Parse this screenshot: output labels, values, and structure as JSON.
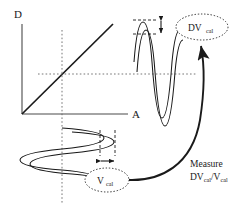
{
  "figure": {
    "background_color": "#ffffff",
    "ink_color": "#1a1a1a",
    "guide_color": "#555555"
  },
  "axes": {
    "y_label": "D",
    "x_label": "A",
    "origin": {
      "x": 22,
      "y": 114
    },
    "y_top": 24,
    "x_right": 128,
    "description": "Linear transfer characteristic, output D versus input amplitude A"
  },
  "transfer_line": {
    "name": "linear-transfer-characteristic",
    "from": {
      "x": 22,
      "y": 114
    },
    "to": {
      "x": 113,
      "y": 24
    },
    "slope_note": "unity-slope linear region"
  },
  "guides": {
    "vertical_operating_point_x": 62,
    "horizontal_operating_point_y": 74,
    "style": "dotted"
  },
  "input_waveform": {
    "name": "input-calibration-waveform",
    "orientation": "vertical-time-axis",
    "center_x": 62,
    "top_y": 126,
    "bottom_y": 196,
    "traces": 2,
    "trace_offset_px": 9,
    "amplitude_px": 42,
    "label": "V",
    "label_subscript": "cal",
    "measure_marker": "horizontal double-headed arrow between two vertical dashed reference lines",
    "ref_line_left_x": 100,
    "ref_line_right_x": 115
  },
  "output_waveform": {
    "name": "output-calibration-waveform",
    "orientation": "horizontal-time-axis",
    "left_x": 134,
    "right_x": 184,
    "center_y": 78,
    "traces": 2,
    "trace_offset_px": 8,
    "amplitude_px": 46,
    "label": "DV",
    "label_subscript": "cal",
    "measure_marker": "vertical double-headed arrow between two horizontal dashed reference lines",
    "ref_line_upper_y": 20,
    "ref_line_lower_y": 34
  },
  "bubbles": [
    {
      "id": "dv-cal-bubble",
      "text": "DV",
      "subscript": "cal",
      "cx": 202,
      "cy": 27,
      "rx": 26,
      "ry": 13
    },
    {
      "id": "v-cal-bubble",
      "text": "V",
      "subscript": "cal",
      "cx": 107,
      "cy": 180,
      "rx": 22,
      "ry": 12
    }
  ],
  "callout": {
    "name": "measure-callout",
    "line1": "Measure",
    "line2_main": "DV",
    "line2_sub1": "cal",
    "line2_div": "/V",
    "line2_sub2": "cal",
    "arrow_description": "curved arrow from V_cal bubble sweeping right and up to DV_cal bubble",
    "arrow_start": {
      "x": 129,
      "y": 180
    },
    "arrow_end": {
      "x": 201,
      "y": 44
    }
  }
}
